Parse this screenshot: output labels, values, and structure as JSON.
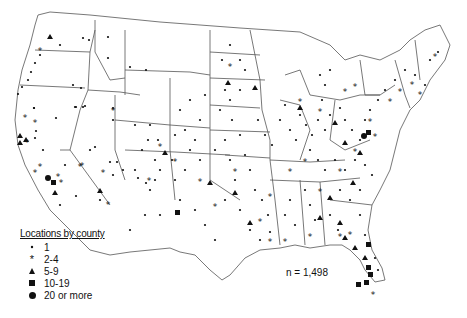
{
  "map": {
    "title": "Locations by county",
    "total": "n = 1,498",
    "legend": [
      {
        "symbol": "dot",
        "label": "1"
      },
      {
        "symbol": "asterisk",
        "label": "2-4"
      },
      {
        "symbol": "triangle",
        "label": "5-9"
      },
      {
        "symbol": "square",
        "label": "10-19"
      },
      {
        "symbol": "circle",
        "label": "20 or more"
      }
    ],
    "colors": {
      "line": "#555555",
      "marker": "#111111",
      "background": "#ffffff"
    }
  }
}
